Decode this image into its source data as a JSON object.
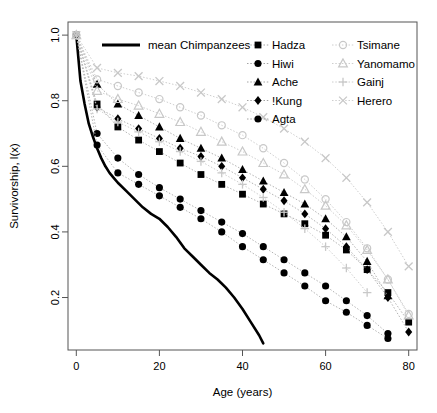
{
  "chart_data": {
    "type": "line",
    "title": "",
    "xlabel": "Age (years)",
    "ylabel": "Survivorship, l(x)",
    "xlim": [
      -2,
      82
    ],
    "ylim": [
      0.04,
      1.04
    ],
    "xticks": [
      0,
      20,
      40,
      60,
      80
    ],
    "yticks": [
      0.2,
      0.4,
      0.6,
      0.8,
      1.0
    ],
    "ytick_labels": [
      "0.2",
      "0.4",
      "0.6",
      "0.8",
      "1.0"
    ],
    "xtick_labels": [
      "0",
      "20",
      "40",
      "60",
      "80"
    ],
    "grid": false,
    "legend_position": "top",
    "series": [
      {
        "name": "mean Chimpanzees",
        "marker": "none",
        "linestyle": "solid",
        "color": "#000000",
        "linewidth": 2.6,
        "x": [
          0,
          1,
          2,
          3,
          4,
          5,
          6,
          7,
          8,
          9,
          10,
          12,
          14,
          16,
          18,
          20,
          22,
          24,
          26,
          28,
          30,
          32,
          34,
          36,
          38,
          40,
          42,
          44,
          45
        ],
        "y": [
          1.0,
          0.86,
          0.79,
          0.73,
          0.69,
          0.655,
          0.625,
          0.6,
          0.58,
          0.565,
          0.55,
          0.525,
          0.5,
          0.475,
          0.455,
          0.44,
          0.415,
          0.385,
          0.35,
          0.325,
          0.3,
          0.275,
          0.255,
          0.23,
          0.2,
          0.165,
          0.125,
          0.085,
          0.06
        ]
      },
      {
        "name": "Hadza",
        "marker": "square",
        "filled": true,
        "color": "#000000",
        "x": [
          0,
          5,
          10,
          15,
          20,
          25,
          30,
          35,
          40,
          45,
          50,
          55,
          60,
          65,
          70,
          75,
          80
        ],
        "y": [
          1.0,
          0.79,
          0.72,
          0.68,
          0.645,
          0.61,
          0.575,
          0.545,
          0.515,
          0.485,
          0.455,
          0.425,
          0.39,
          0.345,
          0.285,
          0.215,
          0.125
        ]
      },
      {
        "name": "Hiwi",
        "marker": "circle",
        "filled": true,
        "color": "#000000",
        "x": [
          0,
          5,
          10,
          15,
          20,
          25,
          30,
          35,
          40,
          45,
          50,
          55,
          60,
          65,
          70,
          75
        ],
        "y": [
          1.0,
          0.7,
          0.625,
          0.575,
          0.535,
          0.5,
          0.465,
          0.43,
          0.395,
          0.355,
          0.315,
          0.275,
          0.235,
          0.19,
          0.145,
          0.09
        ]
      },
      {
        "name": "Ache",
        "marker": "triangle",
        "filled": true,
        "color": "#000000",
        "x": [
          0,
          5,
          10,
          15,
          20,
          25,
          30,
          35,
          40,
          45,
          50,
          55,
          60,
          65,
          70,
          75
        ],
        "y": [
          1.0,
          0.85,
          0.79,
          0.755,
          0.72,
          0.685,
          0.655,
          0.625,
          0.59,
          0.555,
          0.52,
          0.485,
          0.44,
          0.385,
          0.31,
          0.205
        ]
      },
      {
        "name": "!Kung",
        "marker": "diamond",
        "filled": true,
        "color": "#000000",
        "x": [
          0,
          5,
          10,
          15,
          20,
          25,
          30,
          35,
          40,
          45,
          50,
          55,
          60,
          65,
          70,
          75,
          80
        ],
        "y": [
          1.0,
          0.78,
          0.745,
          0.715,
          0.685,
          0.655,
          0.63,
          0.6,
          0.565,
          0.53,
          0.495,
          0.455,
          0.41,
          0.355,
          0.285,
          0.2,
          0.095
        ]
      },
      {
        "name": "Agta",
        "marker": "circle",
        "filled": true,
        "color": "#000000",
        "x": [
          0,
          5,
          10,
          15,
          20,
          25,
          30,
          35,
          40,
          45,
          50,
          55,
          60,
          65,
          70,
          75
        ],
        "y": [
          1.0,
          0.665,
          0.58,
          0.545,
          0.51,
          0.475,
          0.44,
          0.4,
          0.355,
          0.315,
          0.275,
          0.235,
          0.19,
          0.155,
          0.115,
          0.075
        ]
      },
      {
        "name": "Tsimane",
        "marker": "open-circle",
        "filled": false,
        "color": "#c8c8c8",
        "x": [
          0,
          5,
          10,
          15,
          20,
          25,
          30,
          35,
          40,
          45,
          50,
          55,
          60,
          65,
          70,
          75,
          80
        ],
        "y": [
          1.0,
          0.865,
          0.845,
          0.825,
          0.805,
          0.78,
          0.755,
          0.725,
          0.695,
          0.655,
          0.61,
          0.56,
          0.5,
          0.43,
          0.35,
          0.255,
          0.15
        ]
      },
      {
        "name": "Yanomamo",
        "marker": "open-triangle",
        "filled": false,
        "color": "#c8c8c8",
        "x": [
          0,
          5,
          10,
          15,
          20,
          25,
          30,
          35,
          40,
          45,
          50,
          55,
          60,
          65,
          70,
          75,
          80
        ],
        "y": [
          1.0,
          0.83,
          0.805,
          0.785,
          0.76,
          0.735,
          0.705,
          0.675,
          0.645,
          0.61,
          0.575,
          0.53,
          0.48,
          0.42,
          0.345,
          0.255,
          0.145
        ]
      },
      {
        "name": "Gainj",
        "marker": "plus",
        "filled": false,
        "color": "#c8c8c8",
        "x": [
          0,
          5,
          10,
          15,
          20,
          25,
          30,
          35,
          40,
          45,
          50,
          55,
          60,
          65,
          70
        ],
        "y": [
          1.0,
          0.775,
          0.735,
          0.705,
          0.675,
          0.645,
          0.615,
          0.58,
          0.545,
          0.505,
          0.46,
          0.41,
          0.355,
          0.29,
          0.215
        ]
      },
      {
        "name": "Herero",
        "marker": "cross",
        "filled": false,
        "color": "#c8c8c8",
        "x": [
          0,
          5,
          10,
          15,
          20,
          25,
          30,
          35,
          40,
          45,
          50,
          55,
          60,
          65,
          70,
          75,
          80
        ],
        "y": [
          1.0,
          0.9,
          0.885,
          0.875,
          0.86,
          0.845,
          0.825,
          0.805,
          0.78,
          0.75,
          0.715,
          0.675,
          0.625,
          0.565,
          0.49,
          0.4,
          0.295
        ]
      }
    ]
  },
  "legend": {
    "primary": {
      "label": "mean Chimpanzees",
      "swatch": "line-swatch"
    },
    "column1": [
      {
        "label": "Hadza",
        "marker": "square"
      },
      {
        "label": "Hiwi",
        "marker": "circle"
      },
      {
        "label": "Ache",
        "marker": "triangle"
      },
      {
        "label": "!Kung",
        "marker": "diamond"
      },
      {
        "label": "Agta",
        "marker": "circle"
      }
    ],
    "column2": [
      {
        "label": "Tsimane",
        "marker": "open-circle"
      },
      {
        "label": "Yanomamo",
        "marker": "open-triangle"
      },
      {
        "label": "Gainj",
        "marker": "plus"
      },
      {
        "label": "Herero",
        "marker": "cross"
      }
    ]
  },
  "axes": {
    "x_title": "Age (years)",
    "y_title": "Survivorship, l(x)"
  }
}
